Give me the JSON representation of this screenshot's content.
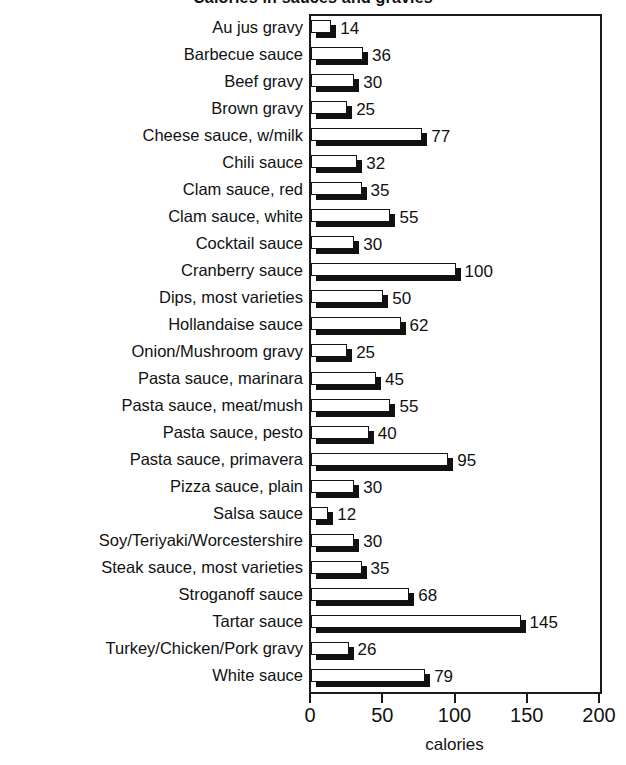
{
  "chart_data": {
    "type": "bar",
    "orientation": "horizontal",
    "title": "Calories in sauces and gravies",
    "xlabel": "calories",
    "ylabel": "",
    "xlim": [
      0,
      200
    ],
    "xticks": [
      0,
      50,
      100,
      150,
      200
    ],
    "xtick_labels": [
      "0",
      "50",
      "100",
      "150",
      "200"
    ],
    "grid": false,
    "legend": null,
    "bar_style": "white-face-with-black-drop-shadow",
    "value_labels_shown": true,
    "categories": [
      "Au jus gravy",
      "Barbecue sauce",
      "Beef gravy",
      "Brown gravy",
      "Cheese sauce, w/milk",
      "Chili sauce",
      "Clam sauce, red",
      "Clam sauce, white",
      "Cocktail sauce",
      "Cranberry sauce",
      "Dips, most varieties",
      "Hollandaise sauce",
      "Onion/Mushroom gravy",
      "Pasta sauce, marinara",
      "Pasta sauce, meat/mush",
      "Pasta sauce, pesto",
      "Pasta sauce, primavera",
      "Pizza sauce, plain",
      "Salsa sauce",
      "Soy/Teriyaki/Worcestershire",
      "Steak sauce, most varieties",
      "Stroganoff sauce",
      "Tartar sauce",
      "Turkey/Chicken/Pork gravy",
      "White sauce"
    ],
    "values": [
      14,
      36,
      30,
      25,
      77,
      32,
      35,
      55,
      30,
      100,
      50,
      62,
      25,
      45,
      55,
      40,
      95,
      30,
      12,
      30,
      35,
      68,
      145,
      26,
      79
    ],
    "value_labels": [
      "14",
      "36",
      "30",
      "25",
      "77",
      "32",
      "35",
      "55",
      "30",
      "100",
      "50",
      "62",
      "25",
      "45",
      "55",
      "40",
      "95",
      "30",
      "12",
      "30",
      "35",
      "68",
      "145",
      "26",
      "79"
    ],
    "colors": {
      "bar_face": "#ffffff",
      "bar_outline": "#131313",
      "bar_shadow": "#111111",
      "axis": "#1a1a1a",
      "text": "#111111",
      "background": "#ffffff"
    }
  }
}
